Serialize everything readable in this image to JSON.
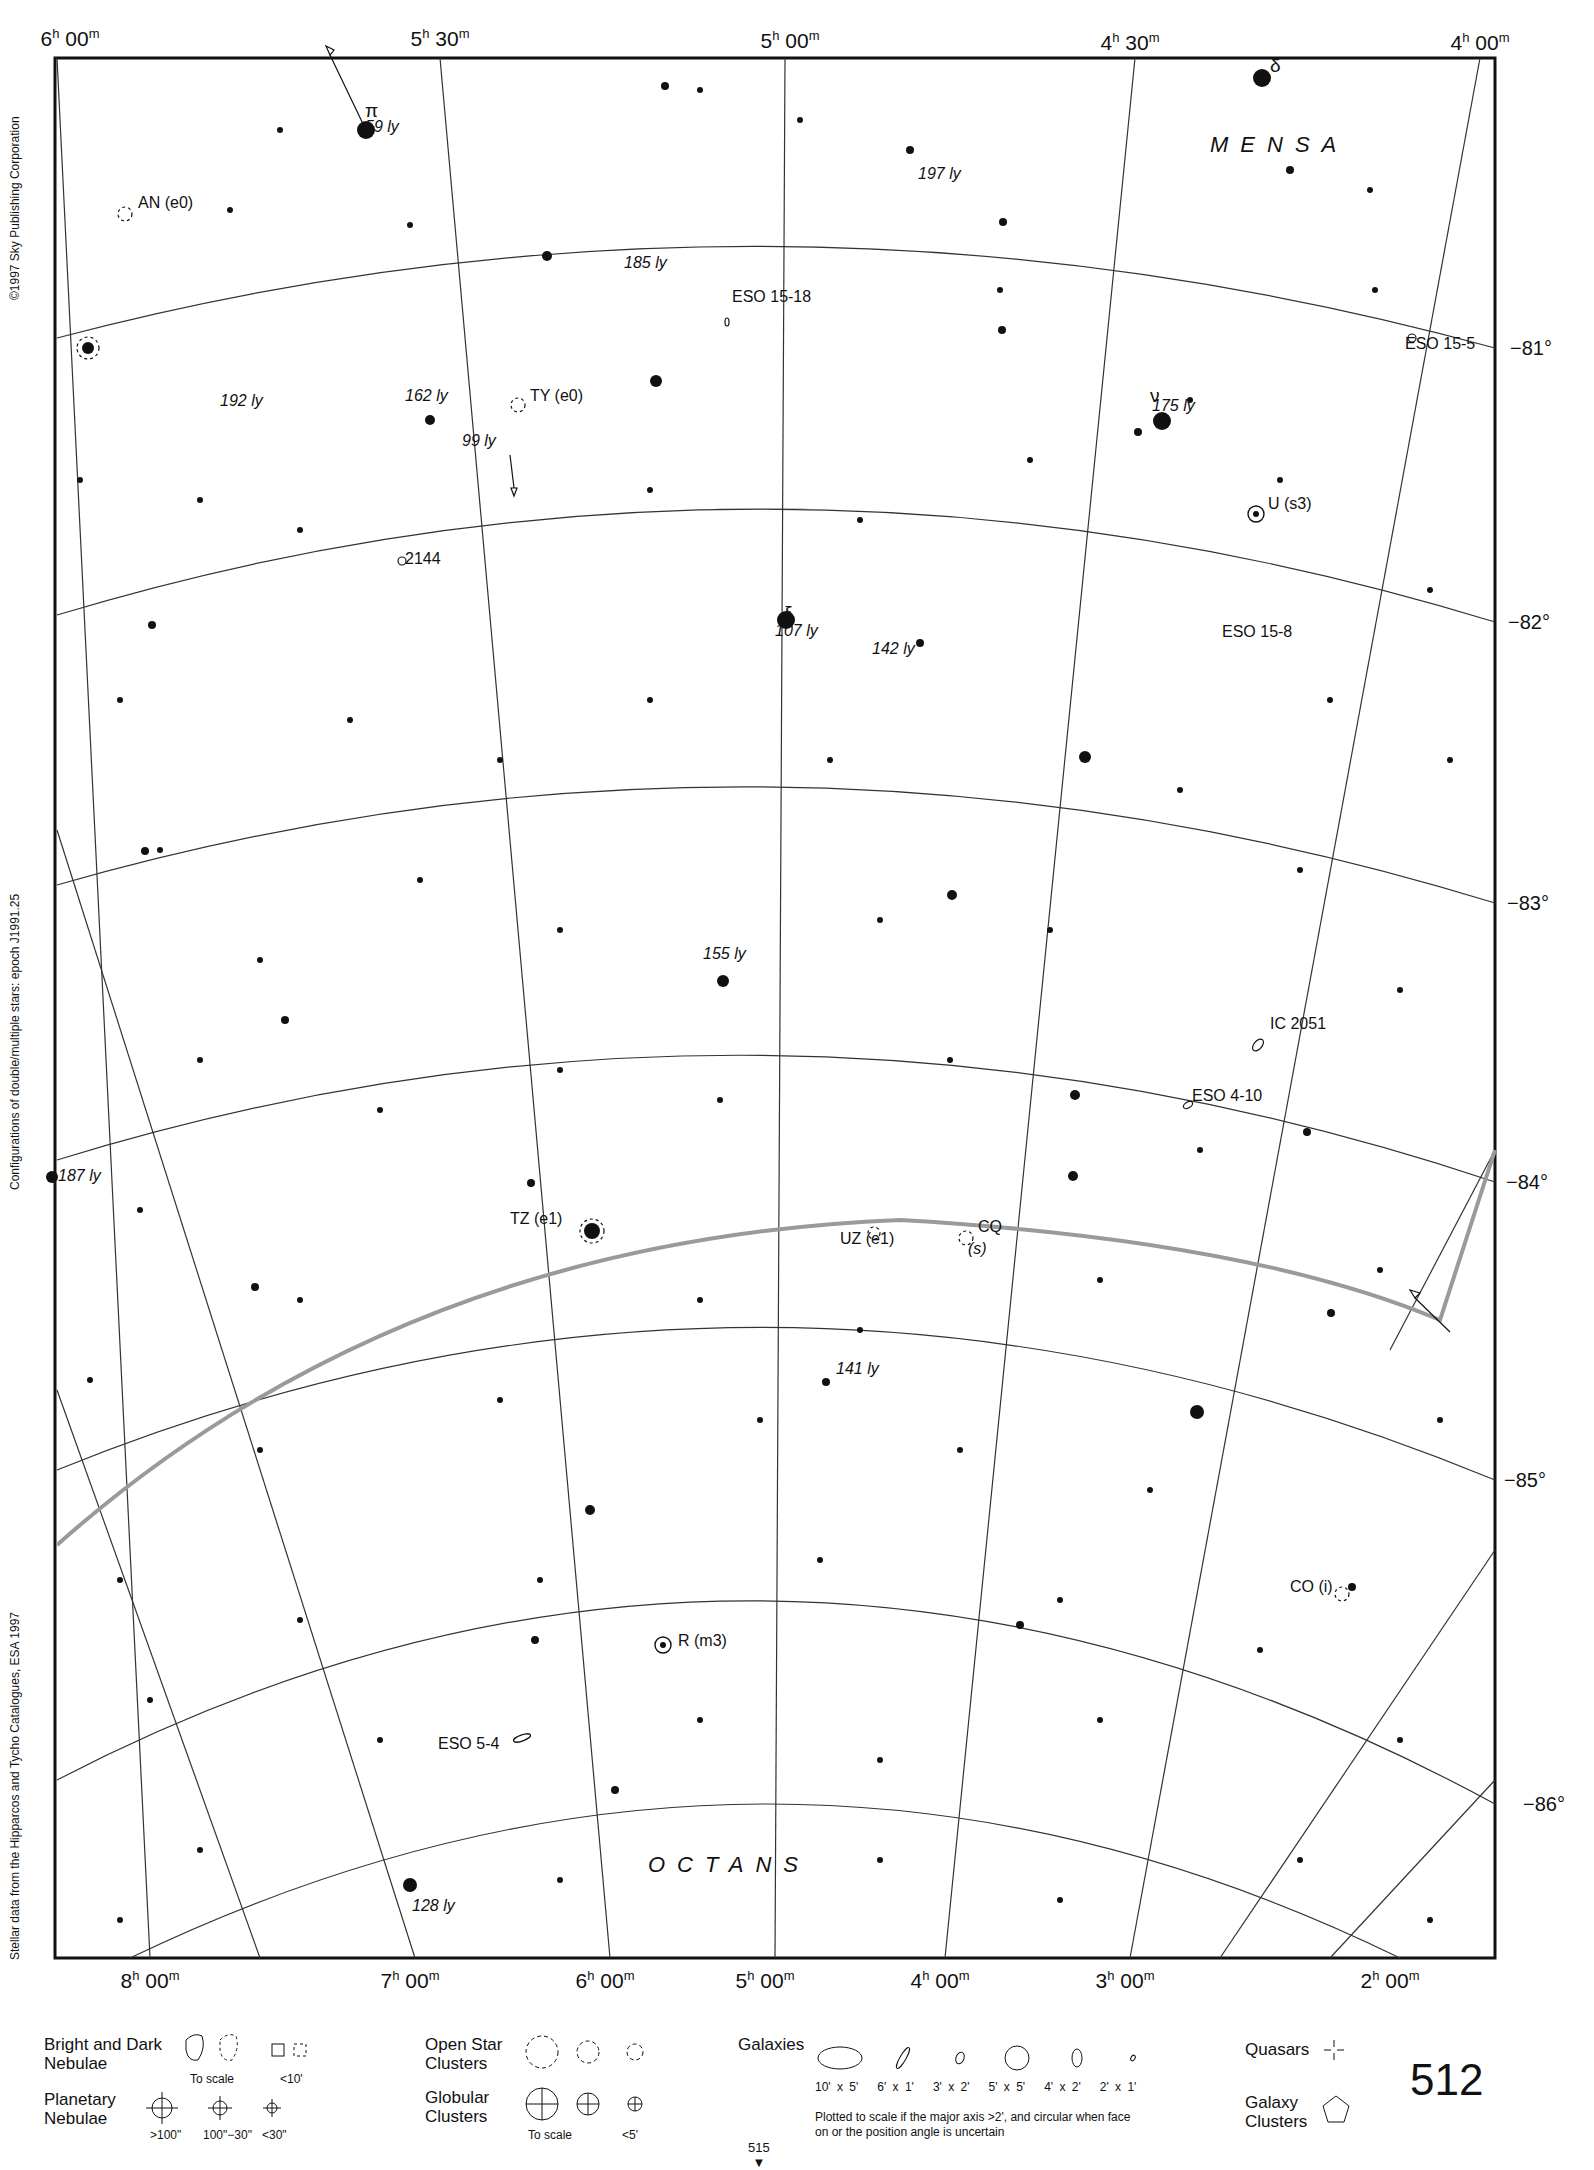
{
  "page": {
    "number": "512",
    "next_page": "515",
    "corner_mark": "81"
  },
  "side_notes": {
    "copyright": "©1997 Sky Publishing Corporation",
    "configurations": "Configurations of double/multiple stars: epoch J1991.25",
    "source": "Stellar data from the Hipparcos and Tycho Catalogues, ESA 1997"
  },
  "axes": {
    "ra_top": [
      {
        "h": "6",
        "m": "00",
        "x": 70
      },
      {
        "h": "5",
        "m": "30",
        "x": 440
      },
      {
        "h": "5",
        "m": "00",
        "x": 790
      },
      {
        "h": "4",
        "m": "30",
        "x": 1130
      },
      {
        "h": "4",
        "m": "00",
        "x": 1480
      }
    ],
    "ra_bottom": [
      {
        "h": "8",
        "m": "00",
        "x": 150
      },
      {
        "h": "7",
        "m": "00",
        "x": 410
      },
      {
        "h": "6",
        "m": "00",
        "x": 605
      },
      {
        "h": "5",
        "m": "00",
        "x": 765
      },
      {
        "h": "4",
        "m": "00",
        "x": 940
      },
      {
        "h": "3",
        "m": "00",
        "x": 1125
      },
      {
        "h": "2",
        "m": "00",
        "x": 1390
      }
    ],
    "dec": [
      {
        "label": "−81°",
        "y": 348
      },
      {
        "label": "−82°",
        "y": 622
      },
      {
        "label": "−83°",
        "y": 903
      },
      {
        "label": "−84°",
        "y": 1182
      },
      {
        "label": "−85°",
        "y": 1480
      },
      {
        "label": "−86°",
        "y": 1804
      }
    ]
  },
  "constellations": [
    {
      "name": "MENSA",
      "x": 1210,
      "y": 135
    },
    {
      "name": "OCTANS",
      "x": 648,
      "y": 1855
    }
  ],
  "labels": [
    {
      "text": "π",
      "x": 365,
      "y": 110,
      "italic": false,
      "kind": "greek"
    },
    {
      "text": "59 ly",
      "x": 365,
      "y": 128,
      "italic": true,
      "kind": "distance"
    },
    {
      "text": "δ",
      "x": 1270,
      "y": 65,
      "italic": false,
      "kind": "greek"
    },
    {
      "text": "197 ly",
      "x": 918,
      "y": 175,
      "italic": true,
      "kind": "distance"
    },
    {
      "text": "AN (e0)",
      "x": 138,
      "y": 204,
      "italic": false,
      "kind": "variable"
    },
    {
      "text": "185 ly",
      "x": 624,
      "y": 264,
      "italic": true,
      "kind": "distance"
    },
    {
      "text": "ESO 15-18",
      "x": 732,
      "y": 298,
      "italic": false,
      "kind": "galaxy"
    },
    {
      "text": "ESO 15-5",
      "x": 1405,
      "y": 345,
      "italic": false,
      "kind": "galaxy"
    },
    {
      "text": "192 ly",
      "x": 220,
      "y": 402,
      "italic": true,
      "kind": "distance"
    },
    {
      "text": "162 ly",
      "x": 405,
      "y": 397,
      "italic": true,
      "kind": "distance"
    },
    {
      "text": "TY (e0)",
      "x": 530,
      "y": 397,
      "italic": false,
      "kind": "variable"
    },
    {
      "text": "ν",
      "x": 1150,
      "y": 395,
      "italic": false,
      "kind": "greek"
    },
    {
      "text": "175 ly",
      "x": 1152,
      "y": 407,
      "italic": true,
      "kind": "distance"
    },
    {
      "text": "99 ly",
      "x": 462,
      "y": 442,
      "italic": true,
      "kind": "distance"
    },
    {
      "text": "U (s3)",
      "x": 1268,
      "y": 505,
      "italic": false,
      "kind": "variable"
    },
    {
      "text": "2144",
      "x": 405,
      "y": 560,
      "italic": false,
      "kind": "galaxy"
    },
    {
      "text": "ξ",
      "x": 784,
      "y": 612,
      "italic": false,
      "kind": "greek"
    },
    {
      "text": "107 ly",
      "x": 775,
      "y": 632,
      "italic": true,
      "kind": "distance"
    },
    {
      "text": "142 ly",
      "x": 872,
      "y": 650,
      "italic": true,
      "kind": "distance"
    },
    {
      "text": "ESO 15-8",
      "x": 1222,
      "y": 633,
      "italic": false,
      "kind": "galaxy"
    },
    {
      "text": "155 ly",
      "x": 703,
      "y": 955,
      "italic": true,
      "kind": "distance"
    },
    {
      "text": "IC 2051",
      "x": 1270,
      "y": 1025,
      "italic": false,
      "kind": "galaxy"
    },
    {
      "text": "ESO 4-10",
      "x": 1192,
      "y": 1097,
      "italic": false,
      "kind": "galaxy"
    },
    {
      "text": "187 ly",
      "x": 58,
      "y": 1177,
      "italic": true,
      "kind": "distance"
    },
    {
      "text": "TZ (e1)",
      "x": 510,
      "y": 1220,
      "italic": false,
      "kind": "variable"
    },
    {
      "text": "UZ (e1)",
      "x": 840,
      "y": 1240,
      "italic": false,
      "kind": "variable"
    },
    {
      "text": "CQ",
      "x": 978,
      "y": 1228,
      "italic": false,
      "kind": "variable"
    },
    {
      "text": "(s)",
      "x": 968,
      "y": 1250,
      "italic": true,
      "kind": "variable"
    },
    {
      "text": "141 ly",
      "x": 836,
      "y": 1370,
      "italic": true,
      "kind": "distance"
    },
    {
      "text": "CO (i)",
      "x": 1290,
      "y": 1588,
      "italic": false,
      "kind": "variable"
    },
    {
      "text": "R (m3)",
      "x": 678,
      "y": 1642,
      "italic": false,
      "kind": "variable"
    },
    {
      "text": "ESO 5-4",
      "x": 438,
      "y": 1745,
      "italic": false,
      "kind": "galaxy"
    },
    {
      "text": "128 ly",
      "x": 412,
      "y": 1907,
      "italic": true,
      "kind": "distance"
    }
  ],
  "legend": {
    "nebulae": {
      "title": "Bright and Dark Nebulae",
      "to_scale": "To scale",
      "small": "<10'"
    },
    "planetary": {
      "title": "Planetary Nebulae",
      "sizes": [
        ">100\"",
        "100\"−30\"",
        "<30\""
      ]
    },
    "open_clusters": {
      "title": "Open Star Clusters"
    },
    "globular": {
      "title": "Globular Clusters",
      "to_scale": "To scale",
      "small": "<5'"
    },
    "galaxies": {
      "title": "Galaxies",
      "sizes": [
        "10' x 5'",
        "6' x 1'",
        "3' x 2'",
        "5' x 5'",
        "4' x 2'",
        "2' x 1'"
      ],
      "note": "Plotted to scale if the major axis >2', and circular when face on or the position angle is uncertain"
    },
    "quasars": {
      "title": "Quasars"
    },
    "galaxy_clusters": {
      "title": "Galaxy Clusters"
    }
  },
  "colors": {
    "ink": "#111111",
    "grid": "#333333",
    "boundary": "#9a9a9a",
    "paper": "#ffffff"
  }
}
